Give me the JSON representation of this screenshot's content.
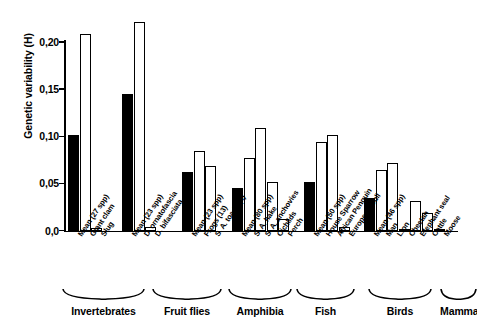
{
  "chart_data": {
    "type": "bar",
    "title": "",
    "xlabel": "",
    "ylabel": "Genetic variability (H)",
    "ylim": [
      0.0,
      0.23
    ],
    "ytick_labels": [
      "0,0",
      "0,05",
      "0,10",
      "0,15",
      "0,20"
    ],
    "ytick_values": [
      0.0,
      0.05,
      0.1,
      0.15,
      0.2
    ],
    "grid": false,
    "legend": "none",
    "series_note": "Filled black bars are group means; hollow bars are individual species",
    "groups": [
      {
        "name": "Invertebrates",
        "categories": [
          "Mean (27 spp)",
          "Giant clam",
          "Slug"
        ],
        "values": [
          0.101,
          0.208,
          0.003
        ],
        "fills": [
          "solid",
          "hollow",
          "hollow"
        ]
      },
      {
        "name": "Fruit flies",
        "categories": [
          "Mean (23 spp)",
          "D. ornatofascia",
          "D. bifasciata"
        ],
        "values": [
          0.145,
          0.221,
          0.004
        ],
        "fills": [
          "solid",
          "hollow",
          "hollow"
        ]
      },
      {
        "name": "Amphibia",
        "categories": [
          "Mean (23 spp)",
          "Frogs (13)",
          "S. A. toads (4)"
        ],
        "values": [
          0.062,
          0.084,
          0.068
        ],
        "fills": [
          "solid",
          "hollow",
          "hollow"
        ]
      },
      {
        "name": "Fish",
        "categories": [
          "Mean (80 spp)",
          "S. A. hake",
          "S. A. anchovies",
          "Cichlids",
          "Perch"
        ],
        "values": [
          0.045,
          0.077,
          0.109,
          0.052,
          0.012
        ],
        "fills": [
          "solid",
          "hollow",
          "hollow",
          "hollow",
          "hollow"
        ]
      },
      {
        "name": "Birds",
        "categories": [
          "Mean (50 spp)",
          "House Sparrow",
          "African Penguin",
          "European Gull"
        ],
        "values": [
          0.052,
          0.094,
          0.101,
          0.004
        ],
        "fills": [
          "solid",
          "hollow",
          "hollow",
          "hollow"
        ]
      },
      {
        "name": "Mammals",
        "categories": [
          "Mean (46 spp)",
          "Man",
          "Lion",
          "Cheetah",
          "Elephant seal",
          "Cattle",
          "Moose"
        ],
        "values": [
          0.035,
          0.064,
          0.072,
          0.002,
          0.031,
          0.019,
          0.001
        ],
        "fills": [
          "solid",
          "hollow",
          "hollow",
          "hollow",
          "hollow",
          "hollow",
          "hollow"
        ]
      }
    ]
  },
  "axis": {
    "y_title": "Genetic variability (H)"
  },
  "ticks": [
    {
      "label": "0,20"
    },
    {
      "label": "0,15"
    },
    {
      "label": "0,10"
    },
    {
      "label": "0,05"
    },
    {
      "label": "0,0"
    }
  ],
  "group_labels": [
    {
      "label": "Invertebrates"
    },
    {
      "label": "Fruit flies"
    },
    {
      "label": "Amphibia"
    },
    {
      "label": "Fish"
    },
    {
      "label": "Birds"
    },
    {
      "label": "Mammals"
    }
  ]
}
